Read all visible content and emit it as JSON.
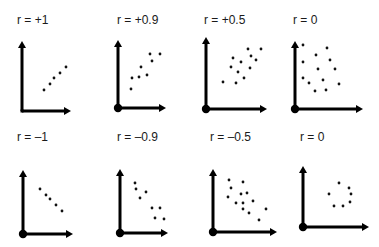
{
  "chart_data": {
    "type": "scatter",
    "title": "",
    "grid": false,
    "legend": null,
    "panels": [
      {
        "label": "r = +1",
        "r": 1,
        "origin_dot": false,
        "axes": {
          "ox": 22,
          "oy": 111,
          "ytip": 41,
          "xtip": 71
        },
        "points": [
          [
            44,
            90
          ],
          [
            50,
            84
          ],
          [
            54,
            78
          ],
          [
            60,
            73
          ],
          [
            66,
            67
          ]
        ]
      },
      {
        "label": "r = +0.9",
        "r": 0.9,
        "origin_dot": true,
        "axes": {
          "ox": 118,
          "oy": 108,
          "ytip": 40,
          "xtip": 166
        },
        "points": [
          [
            131,
            89
          ],
          [
            132,
            78
          ],
          [
            139,
            77
          ],
          [
            141,
            67
          ],
          [
            147,
            75
          ],
          [
            150,
            54
          ],
          [
            152,
            61
          ],
          [
            160,
            54
          ]
        ]
      },
      {
        "label": "r = +0.5",
        "r": 0.5,
        "origin_dot": true,
        "axes": {
          "ox": 206,
          "oy": 109,
          "ytip": 37,
          "xtip": 267
        },
        "points": [
          [
            223,
            82
          ],
          [
            236,
            83
          ],
          [
            244,
            78
          ],
          [
            231,
            67
          ],
          [
            238,
            72
          ],
          [
            233,
            58
          ],
          [
            241,
            62
          ],
          [
            250,
            68
          ],
          [
            248,
            49
          ],
          [
            251,
            56
          ],
          [
            256,
            60
          ],
          [
            261,
            49
          ]
        ]
      },
      {
        "label": "r = 0",
        "r": 0,
        "origin_dot": true,
        "axes": {
          "ox": 295,
          "oy": 109,
          "ytip": 41,
          "xtip": 363
        },
        "points": [
          [
            303,
            45
          ],
          [
            327,
            48
          ],
          [
            316,
            55
          ],
          [
            303,
            62
          ],
          [
            330,
            60
          ],
          [
            318,
            69
          ],
          [
            335,
            69
          ],
          [
            303,
            78
          ],
          [
            309,
            83
          ],
          [
            323,
            80
          ],
          [
            339,
            84
          ],
          [
            315,
            91
          ],
          [
            326,
            90
          ]
        ]
      },
      {
        "label": "r = –1",
        "r": -1,
        "origin_dot": true,
        "axes": {
          "ox": 23,
          "oy": 234,
          "ytip": 170,
          "xtip": 73
        },
        "points": [
          [
            40,
            189
          ],
          [
            46,
            195
          ],
          [
            50,
            199
          ],
          [
            56,
            205
          ],
          [
            62,
            211
          ]
        ]
      },
      {
        "label": "r = –0.9",
        "r": -0.9,
        "origin_dot": true,
        "axes": {
          "ox": 120,
          "oy": 233,
          "ytip": 169,
          "xtip": 168
        },
        "points": [
          [
            135,
            183
          ],
          [
            136,
            189
          ],
          [
            146,
            192
          ],
          [
            140,
            198
          ],
          [
            152,
            208
          ],
          [
            160,
            208
          ],
          [
            155,
            218
          ],
          [
            164,
            219
          ]
        ]
      },
      {
        "label": "r = –0.5",
        "r": -0.5,
        "origin_dot": true,
        "axes": {
          "ox": 213,
          "oy": 232,
          "ytip": 169,
          "xtip": 277
        },
        "points": [
          [
            229,
            180
          ],
          [
            243,
            182
          ],
          [
            231,
            188
          ],
          [
            228,
            197
          ],
          [
            241,
            194
          ],
          [
            247,
            193
          ],
          [
            236,
            203
          ],
          [
            243,
            203
          ],
          [
            253,
            201
          ],
          [
            243,
            209
          ],
          [
            249,
            213
          ],
          [
            266,
            209
          ],
          [
            259,
            220
          ]
        ]
      },
      {
        "label": "r = 0",
        "r": 0,
        "origin_dot": true,
        "axes": {
          "ox": 303,
          "oy": 227,
          "ytip": 166,
          "xtip": 369
        },
        "points": [
          [
            339,
            183
          ],
          [
            349,
            188
          ],
          [
            351,
            194
          ],
          [
            329,
            194
          ],
          [
            350,
            202
          ],
          [
            334,
            206
          ],
          [
            343,
            206
          ]
        ]
      }
    ],
    "label_positions": [
      {
        "x": 17,
        "y": 24
      },
      {
        "x": 117,
        "y": 24
      },
      {
        "x": 204,
        "y": 24
      },
      {
        "x": 293,
        "y": 24
      },
      {
        "x": 17,
        "y": 141
      },
      {
        "x": 117,
        "y": 141
      },
      {
        "x": 210,
        "y": 141
      },
      {
        "x": 300,
        "y": 141
      }
    ],
    "xlabel": "",
    "ylabel": ""
  },
  "labels": {
    "p0": "r = +1",
    "p1": "r = +0.9",
    "p2": "r = +0.5",
    "p3": "r = 0",
    "p4": "r = –1",
    "p5": "r = –0.9",
    "p6": "r = –0.5",
    "p7": "r = 0"
  },
  "colors": {
    "ink": "#000000",
    "background": "#ffffff"
  }
}
